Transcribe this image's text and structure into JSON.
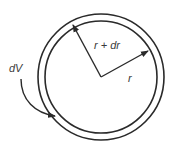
{
  "diagram": {
    "labels": {
      "outer_radius": "r + dr",
      "inner_radius": "r",
      "volume_element": "dV"
    },
    "colors": {
      "stroke": "#2a2a2a",
      "background": "#ffffff"
    }
  }
}
